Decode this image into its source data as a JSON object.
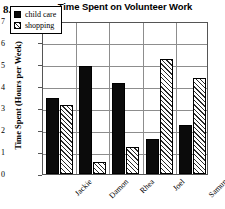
{
  "problem_number": "8.",
  "chart_data": {
    "type": "bar",
    "title": "Time Spent on Volunteer Work",
    "xlabel": "",
    "ylabel": "Time Spent (Hours per Week)",
    "ylim": [
      0,
      7
    ],
    "yticks": [
      0,
      1,
      2,
      3,
      4,
      5,
      6,
      7
    ],
    "ytick_labels": [
      "0",
      "1",
      "2",
      "3",
      "4",
      "5",
      "6",
      "7"
    ],
    "grid": true,
    "legend_position": "upper-left",
    "categories": [
      "Jackie",
      "Damon",
      "Rhea",
      "Joel",
      "Samun"
    ],
    "series": [
      {
        "name": "child care",
        "color": "#0b0b0b",
        "pattern": "solid",
        "values": [
          3.5,
          4.95,
          4.15,
          1.6,
          2.25
        ]
      },
      {
        "name": "shopping",
        "color": "#ffffff",
        "pattern": "hatched",
        "values": [
          3.15,
          0.55,
          1.25,
          5.25,
          4.4
        ]
      }
    ]
  }
}
